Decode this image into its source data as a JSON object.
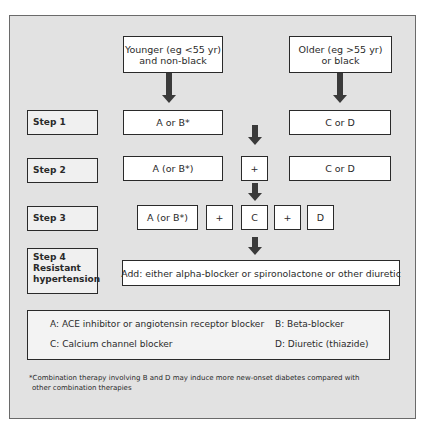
{
  "diagram": {
    "groups": {
      "younger": "Younger (eg <55 yr)\nand non-black",
      "younger_line1": "Younger (eg <55 yr)",
      "younger_line2": "and non-black",
      "older_line1": "Older (eg >55 yr)",
      "older_line2": "or black"
    },
    "steps": [
      {
        "label": "Step 1",
        "boxes": [
          "A or B*",
          "C or D"
        ]
      },
      {
        "label": "Step 2",
        "boxes": [
          "A (or B*)",
          "+",
          "C or D"
        ]
      },
      {
        "label": "Step 3",
        "boxes": [
          "A (or B*)",
          "+",
          "C",
          "+",
          "D"
        ]
      },
      {
        "label": "Step 4",
        "label_line2": "Resistant",
        "label_line3": "hypertension",
        "boxes": [
          "Add: either alpha-blocker or spironolactone or other diuretic"
        ]
      }
    ],
    "legend": {
      "a": "A: ACE inhibitor or angiotensin receptor blocker",
      "b": "B: Beta-blocker",
      "c": "C: Calcium channel blocker",
      "d": "D: Diuretic (thiazide)"
    },
    "footnote_line1": "*Combination therapy involving B and D may induce more new-onset diabetes compared with",
    "footnote_line2": "other combination therapies"
  }
}
